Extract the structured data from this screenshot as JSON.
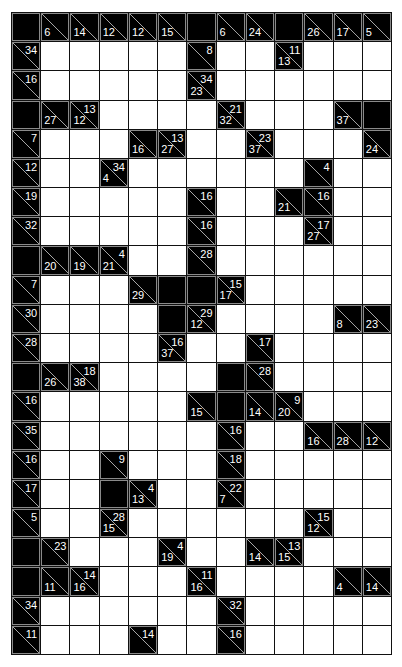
{
  "puzzle": {
    "type": "kakuro",
    "columns": 13,
    "rows": 22,
    "legend": "Cell codes: B = black blank, W = white entry cell, 'down\\across' = clue cell (down sum bottom-left, across sum top-right)",
    "grid": [
      [
        "B",
        "6\\",
        "14\\",
        "12\\",
        "12\\",
        "15\\",
        "B",
        "6\\",
        "24\\",
        "B",
        "26\\",
        "17\\",
        "5\\"
      ],
      [
        "\\34",
        "W",
        "W",
        "W",
        "W",
        "W",
        "\\8",
        "W",
        "W",
        "13\\11",
        "W",
        "W",
        "W"
      ],
      [
        "\\16",
        "W",
        "W",
        "W",
        "W",
        "W",
        "23\\34",
        "W",
        "W",
        "W",
        "W",
        "W",
        "W"
      ],
      [
        "B",
        "27\\",
        "12\\13",
        "W",
        "W",
        "W",
        "W",
        "32\\21",
        "W",
        "W",
        "W",
        "37\\",
        "B"
      ],
      [
        "\\7",
        "W",
        "W",
        "W",
        "16\\",
        "27\\13",
        "W",
        "W",
        "37\\23",
        "W",
        "W",
        "W",
        "24\\"
      ],
      [
        "\\12",
        "W",
        "W",
        "4\\34",
        "W",
        "W",
        "W",
        "W",
        "W",
        "W",
        "\\4",
        "W",
        "W"
      ],
      [
        "\\19",
        "W",
        "W",
        "W",
        "W",
        "W",
        "\\16",
        "W",
        "W",
        "21\\",
        "\\16",
        "W",
        "W"
      ],
      [
        "\\32",
        "W",
        "W",
        "W",
        "W",
        "W",
        "\\16",
        "W",
        "W",
        "W",
        "27\\17",
        "W",
        "W"
      ],
      [
        "B",
        "20\\",
        "19\\",
        "21\\4",
        "W",
        "W",
        "\\28",
        "W",
        "W",
        "W",
        "W",
        "W",
        "W"
      ],
      [
        "\\7",
        "W",
        "W",
        "W",
        "29\\",
        "B",
        "B",
        "17\\15",
        "W",
        "W",
        "W",
        "W",
        "W"
      ],
      [
        "\\30",
        "W",
        "W",
        "W",
        "W",
        "B",
        "12\\29",
        "W",
        "W",
        "W",
        "W",
        "8\\",
        "23\\"
      ],
      [
        "\\28",
        "W",
        "W",
        "W",
        "W",
        "37\\16",
        "W",
        "W",
        "\\17",
        "W",
        "W",
        "W",
        "W"
      ],
      [
        "B",
        "26\\",
        "38\\18",
        "W",
        "W",
        "W",
        "W",
        "B",
        "\\28",
        "W",
        "W",
        "W",
        "W"
      ],
      [
        "\\16",
        "W",
        "W",
        "W",
        "W",
        "W",
        "15\\",
        "B",
        "14\\",
        "20\\9",
        "W",
        "W",
        "W"
      ],
      [
        "\\35",
        "W",
        "W",
        "W",
        "W",
        "W",
        "W",
        "\\16",
        "W",
        "W",
        "16\\",
        "28\\",
        "12\\"
      ],
      [
        "\\16",
        "W",
        "W",
        "\\9",
        "W",
        "W",
        "W",
        "\\18",
        "W",
        "W",
        "W",
        "W",
        "W"
      ],
      [
        "\\17",
        "W",
        "W",
        "B",
        "13\\4",
        "W",
        "W",
        "7\\22",
        "W",
        "W",
        "W",
        "W",
        "W"
      ],
      [
        "\\5",
        "W",
        "W",
        "15\\28",
        "W",
        "W",
        "W",
        "W",
        "W",
        "W",
        "12\\15",
        "W",
        "W"
      ],
      [
        "B",
        "\\23",
        "W",
        "W",
        "W",
        "19\\4",
        "W",
        "W",
        "14\\",
        "15\\13",
        "W",
        "W",
        "W"
      ],
      [
        "B",
        "11\\",
        "16\\14",
        "W",
        "W",
        "W",
        "16\\11",
        "W",
        "W",
        "W",
        "W",
        "4\\",
        "14\\"
      ],
      [
        "\\34",
        "W",
        "W",
        "W",
        "W",
        "W",
        "W",
        "\\32",
        "W",
        "W",
        "W",
        "W",
        "W"
      ],
      [
        "\\11",
        "W",
        "W",
        "W",
        "\\14",
        "W",
        "W",
        "\\16",
        "W",
        "W",
        "W",
        "W",
        "W"
      ]
    ]
  },
  "colors": {
    "background": "#ffffff",
    "block": "#000000",
    "block_border": "#8a8a8a",
    "clue_text": "#ffffff",
    "grid_line": "#111111"
  }
}
